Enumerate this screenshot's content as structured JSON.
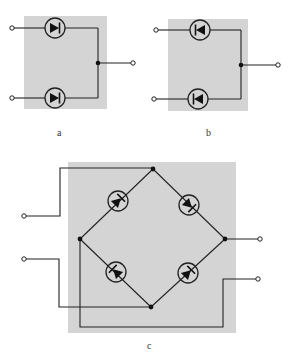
{
  "figure": {
    "panels": [
      {
        "id": "a",
        "label": "a",
        "description": "Two diodes, anodes at inputs, cathodes joined to common output"
      },
      {
        "id": "b",
        "label": "b",
        "description": "Two diodes, cathodes at inputs, anodes joined to common output"
      },
      {
        "id": "c",
        "label": "c",
        "description": "Four-diode bridge with two input terminals and two output terminals"
      }
    ],
    "colors": {
      "panel_fill": "#d4d4d4",
      "wire": "#222222",
      "background": "#ffffff"
    }
  }
}
